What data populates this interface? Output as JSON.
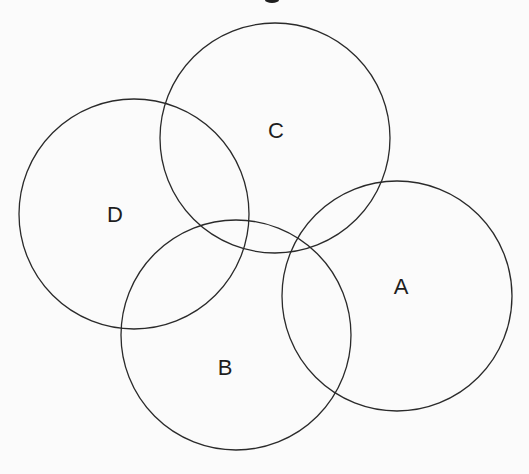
{
  "diagram": {
    "type": "intersecting-circles",
    "background": "#fbfbfb",
    "stroke_color": "#2a2a2a",
    "circles": [
      {
        "id": "A",
        "label": "A",
        "cx": 397,
        "cy": 296,
        "r": 115,
        "label_x": 401,
        "label_y": 286
      },
      {
        "id": "B",
        "label": "B",
        "cx": 236,
        "cy": 335,
        "r": 115,
        "label_x": 225,
        "label_y": 367
      },
      {
        "id": "C",
        "label": "C",
        "cx": 275,
        "cy": 138,
        "r": 115,
        "label_x": 276,
        "label_y": 130
      },
      {
        "id": "D",
        "label": "D",
        "cx": 134,
        "cy": 214,
        "r": 115,
        "label_x": 115,
        "label_y": 214
      }
    ]
  }
}
